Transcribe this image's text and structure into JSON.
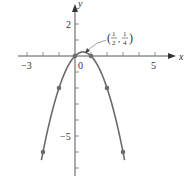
{
  "chart_data": {
    "type": "line",
    "title": "",
    "function": "y = x - x^2",
    "xlabel": "x",
    "ylabel": "y",
    "xlim": [
      -3.6,
      6.3
    ],
    "ylim": [
      -7.5,
      3.5
    ],
    "grid": false,
    "x_ticks": [
      -3,
      -2,
      -1,
      0,
      1,
      2,
      3,
      4,
      5
    ],
    "y_ticks": [
      2,
      1,
      -1,
      -2,
      -3,
      -4,
      -5,
      -6,
      -7
    ],
    "x_tick_labels": [
      {
        "value": -3,
        "label": "−3"
      },
      {
        "value": 0,
        "label": "0"
      },
      {
        "value": 5,
        "label": "5"
      }
    ],
    "y_tick_labels": [
      {
        "value": 2,
        "label": "2"
      },
      {
        "value": -5,
        "label": "−5"
      }
    ],
    "series": [
      {
        "name": "parabola",
        "x": [
          -2.1,
          -2,
          -1,
          0,
          0.5,
          1,
          2,
          3,
          3.1
        ],
        "y": [
          -6.51,
          -6,
          -2,
          0,
          0.25,
          0,
          -2,
          -6,
          -6.51
        ]
      }
    ],
    "marked_points": [
      {
        "x": -2,
        "y": -6
      },
      {
        "x": -1,
        "y": -2
      },
      {
        "x": 0,
        "y": 0
      },
      {
        "x": 1,
        "y": 0
      },
      {
        "x": 2,
        "y": -2
      },
      {
        "x": 3,
        "y": -6
      }
    ],
    "annotations": [
      {
        "text": "(1/2, 1/4)",
        "x": 0.5,
        "y": 0.25,
        "num1": "1",
        "den1": "2",
        "num2": "1",
        "den2": "4"
      }
    ],
    "colors": {
      "curve": "#6b6b6b",
      "axis": "#555555",
      "points": "#6b6b6b"
    }
  }
}
